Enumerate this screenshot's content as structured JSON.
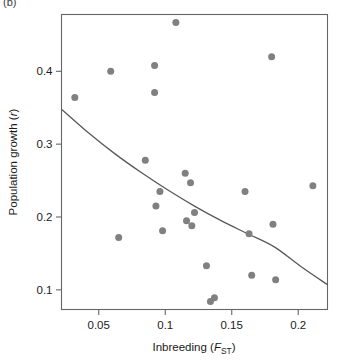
{
  "figure": {
    "panel_label": "(b)"
  },
  "chart_data": {
    "type": "scatter",
    "title": "",
    "xlabel": "Inbreeding (FST)",
    "xlabel_main": "Inbreeding (",
    "xlabel_italic": "F",
    "xlabel_sub": "ST",
    "xlabel_close": ")",
    "ylabel": "Population growth (r)",
    "ylabel_main": "Population growth (",
    "ylabel_italic": "r",
    "ylabel_close": ")",
    "xlim": [
      0.022,
      0.222
    ],
    "ylim": [
      0.073,
      0.478
    ],
    "xticks": [
      0.05,
      0.1,
      0.15,
      0.2
    ],
    "xtick_labels": [
      "0.05",
      "0.1",
      "0.15",
      "0.2"
    ],
    "yticks": [
      0.1,
      0.2,
      0.3,
      0.4
    ],
    "ytick_labels": [
      "0.1",
      "0.2",
      "0.3",
      "0.4"
    ],
    "grid": false,
    "legend": null,
    "point_color": "#808080",
    "line_color": "#595959",
    "axis_color": "#666666",
    "points": [
      {
        "x": 0.032,
        "y": 0.364
      },
      {
        "x": 0.059,
        "y": 0.4
      },
      {
        "x": 0.065,
        "y": 0.172
      },
      {
        "x": 0.085,
        "y": 0.278
      },
      {
        "x": 0.092,
        "y": 0.408
      },
      {
        "x": 0.092,
        "y": 0.371
      },
      {
        "x": 0.093,
        "y": 0.215
      },
      {
        "x": 0.096,
        "y": 0.235
      },
      {
        "x": 0.098,
        "y": 0.181
      },
      {
        "x": 0.108,
        "y": 0.467
      },
      {
        "x": 0.115,
        "y": 0.26
      },
      {
        "x": 0.116,
        "y": 0.195
      },
      {
        "x": 0.119,
        "y": 0.247
      },
      {
        "x": 0.12,
        "y": 0.188
      },
      {
        "x": 0.122,
        "y": 0.206
      },
      {
        "x": 0.131,
        "y": 0.133
      },
      {
        "x": 0.134,
        "y": 0.084
      },
      {
        "x": 0.137,
        "y": 0.089
      },
      {
        "x": 0.16,
        "y": 0.235
      },
      {
        "x": 0.163,
        "y": 0.177
      },
      {
        "x": 0.165,
        "y": 0.12
      },
      {
        "x": 0.18,
        "y": 0.42
      },
      {
        "x": 0.181,
        "y": 0.19
      },
      {
        "x": 0.183,
        "y": 0.114
      },
      {
        "x": 0.211,
        "y": 0.243
      }
    ],
    "fit_curve": {
      "description": "decreasing exponential-like fitted trend line",
      "x": [
        0.022,
        0.042,
        0.062,
        0.082,
        0.102,
        0.122,
        0.142,
        0.162,
        0.182,
        0.202,
        0.222
      ],
      "y": [
        0.348,
        0.316,
        0.287,
        0.261,
        0.237,
        0.215,
        0.195,
        0.177,
        0.159,
        0.132,
        0.107
      ]
    }
  }
}
